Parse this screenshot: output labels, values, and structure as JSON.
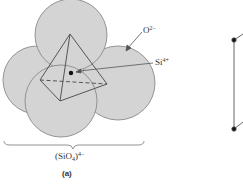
{
  "figure": {
    "caption": "(a)",
    "formula": {
      "base": "(SiO",
      "subscript": "4",
      "close": ")",
      "charge": "4−"
    },
    "labels": {
      "oxygen": {
        "symbol": "O",
        "charge": "2−"
      },
      "silicon": {
        "symbol": "Si",
        "charge": "4+"
      }
    },
    "colors": {
      "sphere_fill": "#d4d4d4",
      "sphere_stroke": "#8a8a8a",
      "edge": "#555555",
      "dot": "#111111"
    }
  }
}
